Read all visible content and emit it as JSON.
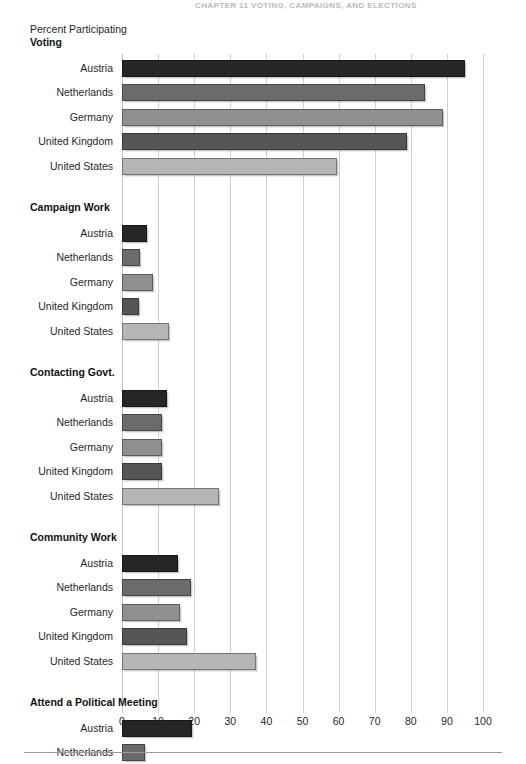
{
  "page": {
    "running_header": "CHAPTER 11   VOTING, CAMPAIGNS, AND ELECTIONS"
  },
  "chart_data": {
    "type": "bar",
    "orientation": "horizontal",
    "title": "",
    "xlabel": "",
    "ylabel": "Percent Participating",
    "axis_title": "Percent Participating",
    "xlim": [
      0,
      100
    ],
    "xticks": [
      "0",
      "10",
      "20",
      "30",
      "40",
      "50",
      "60",
      "70",
      "80",
      "90",
      "100"
    ],
    "grid": true,
    "legend": "none",
    "categories": [
      "Austria",
      "Netherlands",
      "Germany",
      "United Kingdom",
      "United States"
    ],
    "category_colors": {
      "Austria": "#262626",
      "Netherlands": "#6b6b6b",
      "Germany": "#909090",
      "United Kingdom": "#565656",
      "United States": "#b5b5b5"
    },
    "groups": [
      {
        "label": "Voting",
        "bars": [
          {
            "category": "Austria",
            "value": 95,
            "color": "#262626"
          },
          {
            "category": "Netherlands",
            "value": 84,
            "color": "#6b6b6b"
          },
          {
            "category": "Germany",
            "value": 89,
            "color": "#909090"
          },
          {
            "category": "United Kingdom",
            "value": 79,
            "color": "#565656"
          },
          {
            "category": "United States",
            "value": 59.5,
            "color": "#b5b5b5"
          }
        ]
      },
      {
        "label": "Campaign Work",
        "bars": [
          {
            "category": "Austria",
            "value": 7,
            "color": "#262626"
          },
          {
            "category": "Netherlands",
            "value": 5,
            "color": "#6b6b6b"
          },
          {
            "category": "Germany",
            "value": 8.5,
            "color": "#909090"
          },
          {
            "category": "United Kingdom",
            "value": 4.8,
            "color": "#565656"
          },
          {
            "category": "United States",
            "value": 13,
            "color": "#b5b5b5"
          }
        ]
      },
      {
        "label": "Contacting Govt.",
        "bars": [
          {
            "category": "Austria",
            "value": 12.5,
            "color": "#262626"
          },
          {
            "category": "Netherlands",
            "value": 11,
            "color": "#6b6b6b"
          },
          {
            "category": "Germany",
            "value": 11,
            "color": "#909090"
          },
          {
            "category": "United Kingdom",
            "value": 11,
            "color": "#565656"
          },
          {
            "category": "United States",
            "value": 27,
            "color": "#b5b5b5"
          }
        ]
      },
      {
        "label": "Community Work",
        "bars": [
          {
            "category": "Austria",
            "value": 15.5,
            "color": "#262626"
          },
          {
            "category": "Netherlands",
            "value": 19,
            "color": "#6b6b6b"
          },
          {
            "category": "Germany",
            "value": 16,
            "color": "#909090"
          },
          {
            "category": "United Kingdom",
            "value": 18,
            "color": "#565656"
          },
          {
            "category": "United States",
            "value": 37,
            "color": "#b5b5b5"
          }
        ]
      },
      {
        "label": "Attend a Political Meeting",
        "bars": [
          {
            "category": "Austria",
            "value": 19.5,
            "color": "#262626"
          },
          {
            "category": "Netherlands",
            "value": 6.5,
            "color": "#6b6b6b"
          },
          {
            "category": "Germany",
            "value": 22,
            "color": "#909090"
          },
          {
            "category": "United Kingdom",
            "value": 10,
            "color": "#565656"
          },
          {
            "category": "United States",
            "value": 19,
            "color": "#b5b5b5"
          }
        ]
      }
    ]
  }
}
